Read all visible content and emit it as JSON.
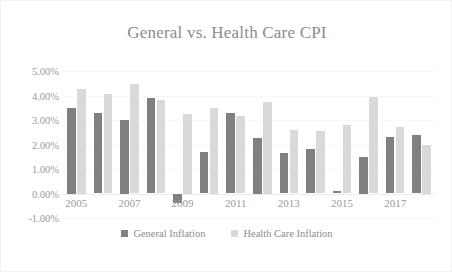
{
  "chart_data": {
    "type": "bar",
    "title": "General vs. Health Care CPI",
    "xlabel": "",
    "ylabel": "",
    "ylim": [
      -1.0,
      5.0
    ],
    "ytick_labels": [
      "5.00%",
      "4.00%",
      "3.00%",
      "2.00%",
      "1.00%",
      "0.00%",
      "-1.00%"
    ],
    "ytick_values": [
      5.0,
      4.0,
      3.0,
      2.0,
      1.0,
      0.0,
      -1.0
    ],
    "grid": true,
    "legend_position": "bottom",
    "categories": [
      "2005",
      "2006",
      "2007",
      "2008",
      "2009",
      "2010",
      "2011",
      "2012",
      "2013",
      "2014",
      "2015",
      "2016",
      "2017",
      "2018"
    ],
    "xtick_labels": [
      "2005",
      "2007",
      "2009",
      "2011",
      "2013",
      "2015",
      "2017"
    ],
    "series": [
      {
        "name": "General Inflation",
        "color": "#808080",
        "values": [
          3.5,
          3.3,
          3.0,
          3.9,
          -0.4,
          1.7,
          3.3,
          2.25,
          1.65,
          1.8,
          0.1,
          1.5,
          2.3,
          2.4
        ]
      },
      {
        "name": "Health Care Inflation",
        "color": "#d9d9d9",
        "values": [
          4.25,
          4.05,
          4.45,
          3.8,
          3.25,
          3.5,
          3.15,
          3.75,
          2.6,
          2.55,
          2.8,
          3.95,
          2.7,
          2.0
        ]
      }
    ]
  },
  "legend": {
    "items": [
      {
        "label": "General Inflation",
        "swatch_class": "general"
      },
      {
        "label": "Health Care Inflation",
        "swatch_class": "health"
      }
    ]
  }
}
